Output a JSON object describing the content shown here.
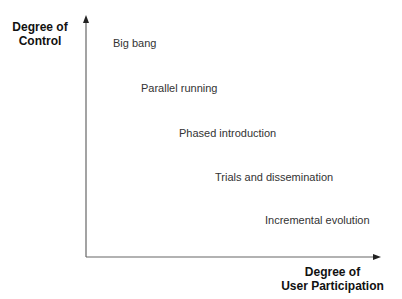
{
  "diagram": {
    "y_axis_label": [
      "Degree of",
      "Control"
    ],
    "x_axis_label": [
      "Degree of",
      "User Participation"
    ],
    "items": [
      {
        "label": "Big bang",
        "x": 113,
        "y": 37
      },
      {
        "label": "Parallel running",
        "x": 141,
        "y": 82
      },
      {
        "label": "Phased introduction",
        "x": 179,
        "y": 127
      },
      {
        "label": "Trials and dissemination",
        "x": 215,
        "y": 171
      },
      {
        "label": "Incremental evolution",
        "x": 265,
        "y": 214
      }
    ],
    "axis_color": "#555555"
  }
}
